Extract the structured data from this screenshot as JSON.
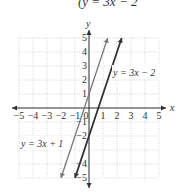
{
  "title": "(y = 3x − 2",
  "chart_data": {
    "type": "line",
    "title": "(y = 3x − 2",
    "xlabel": "x",
    "ylabel": "y",
    "xlim": [
      -5,
      5
    ],
    "ylim": [
      -5,
      5
    ],
    "grid": true,
    "x_ticks": [
      "−5",
      "−4",
      "−3",
      "−2",
      "−1",
      "0",
      "1",
      "2",
      "3",
      "4",
      "5"
    ],
    "y_ticks": [
      "5",
      "4",
      "3",
      "2",
      "1",
      "−1",
      "−2",
      "−4",
      "−5"
    ],
    "series": [
      {
        "name": "y = 3x + 1",
        "slope": 3,
        "intercept": 1,
        "x": [
          -2,
          1.333
        ],
        "y": [
          -5,
          5
        ],
        "color": "#777777"
      },
      {
        "name": "y = 3x − 2",
        "slope": 3,
        "intercept": -2,
        "x": [
          -1,
          2.333
        ],
        "y": [
          -5,
          5
        ],
        "color": "#333333"
      }
    ],
    "annotations": [
      "y = 3x + 1",
      "y = 3x − 2"
    ]
  },
  "labels": {
    "x_axis": "x",
    "y_axis": "y",
    "line1": "y = 3x + 1",
    "line2": "y = 3x − 2",
    "origin": "0"
  }
}
